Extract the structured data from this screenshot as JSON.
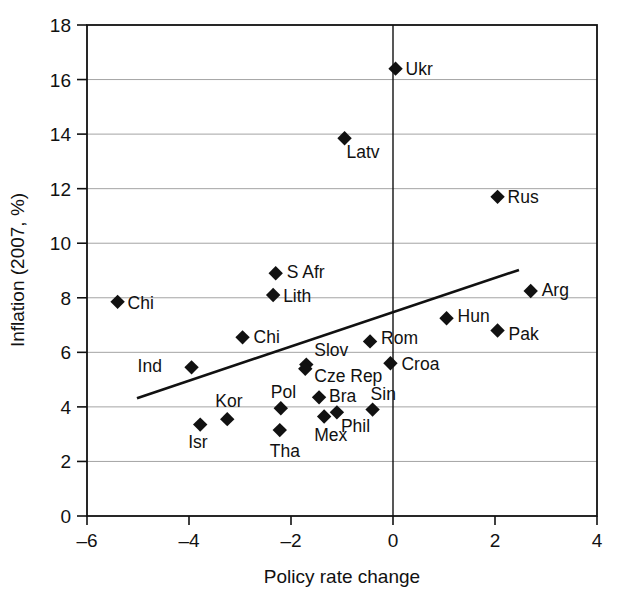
{
  "chart_data": {
    "type": "scatter",
    "title": "",
    "xlabel": "Policy rate change",
    "ylabel": "Inflation (2007, %)",
    "xlim": [
      -6,
      4
    ],
    "ylim": [
      0,
      18
    ],
    "xticks": [
      "-6",
      "-4",
      "-2",
      "0",
      "2",
      "4"
    ],
    "xtick_values": [
      -6,
      -4,
      -2,
      0,
      2,
      4
    ],
    "yticks": [
      "0",
      "2",
      "4",
      "6",
      "8",
      "10",
      "12",
      "14",
      "16",
      "18"
    ],
    "ytick_values": [
      0,
      2,
      4,
      6,
      8,
      10,
      12,
      14,
      16,
      18
    ],
    "grid": true,
    "grid_axis": "y",
    "legend": "none",
    "marker_shape": "diamond",
    "marker_color": "#111111",
    "points": [
      {
        "label": "Ukr",
        "x": 0.05,
        "y": 16.4,
        "lx": 10,
        "ly": 6
      },
      {
        "label": "Latv",
        "x": -0.95,
        "y": 13.85,
        "lx": 2,
        "ly": 20
      },
      {
        "label": "Rus",
        "x": 2.05,
        "y": 11.7,
        "lx": 10,
        "ly": 6
      },
      {
        "label": "S Afr",
        "x": -2.3,
        "y": 8.9,
        "lx": 11,
        "ly": 5
      },
      {
        "label": "Arg",
        "x": 2.7,
        "y": 8.25,
        "lx": 11,
        "ly": 5
      },
      {
        "label": "Lith",
        "x": -2.35,
        "y": 8.1,
        "lx": 10,
        "ly": 7
      },
      {
        "label": "Chi",
        "x": -5.4,
        "y": 7.85,
        "lx": 10,
        "ly": 7
      },
      {
        "label": "Hun",
        "x": 1.05,
        "y": 7.25,
        "lx": 11,
        "ly": 4
      },
      {
        "label": "Pak",
        "x": 2.05,
        "y": 6.8,
        "lx": 11,
        "ly": 9
      },
      {
        "label": "Chi",
        "x": -2.95,
        "y": 6.55,
        "lx": 11,
        "ly": 6
      },
      {
        "label": "Rom",
        "x": -0.45,
        "y": 6.4,
        "lx": 11,
        "ly": 3
      },
      {
        "label": "Slov",
        "x": -1.7,
        "y": 5.55,
        "lx": 8,
        "ly": -9
      },
      {
        "label": "Cze Rep",
        "x": -1.72,
        "y": 5.4,
        "lx": 9,
        "ly": 13
      },
      {
        "label": "Croa",
        "x": -0.05,
        "y": 5.6,
        "lx": 11,
        "ly": 7
      },
      {
        "label": "Ind",
        "x": -3.95,
        "y": 5.45,
        "lx": -54,
        "ly": 5
      },
      {
        "label": "Bra",
        "x": -1.45,
        "y": 4.35,
        "lx": 10,
        "ly": 5
      },
      {
        "label": "Pol",
        "x": -2.2,
        "y": 3.95,
        "lx": -10,
        "ly": -10
      },
      {
        "label": "Sin",
        "x": -0.4,
        "y": 3.9,
        "lx": -2,
        "ly": -10
      },
      {
        "label": "Phil",
        "x": -1.1,
        "y": 3.8,
        "lx": 4,
        "ly": 20
      },
      {
        "label": "Mex",
        "x": -1.35,
        "y": 3.65,
        "lx": -10,
        "ly": 25
      },
      {
        "label": "Kor",
        "x": -3.25,
        "y": 3.55,
        "lx": -12,
        "ly": -12
      },
      {
        "label": "Isr",
        "x": -3.78,
        "y": 3.35,
        "lx": -12,
        "ly": 23
      },
      {
        "label": "Tha",
        "x": -2.22,
        "y": 3.15,
        "lx": -10,
        "ly": 27
      }
    ],
    "trendline": {
      "x0": -5.02,
      "y0": 4.32,
      "x1": 2.47,
      "y1": 9.02
    }
  }
}
